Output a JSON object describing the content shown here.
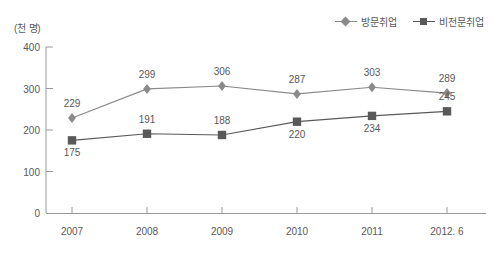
{
  "chart_data": {
    "type": "line",
    "title": "",
    "subtitle": "",
    "unit_label": "(천 명)",
    "xlabel": "",
    "ylabel": "",
    "categories": [
      "2007",
      "2008",
      "2009",
      "2010",
      "2011",
      "2012. 6"
    ],
    "yticks": [
      "0",
      "100",
      "200",
      "300",
      "400"
    ],
    "ylim": [
      0,
      400
    ],
    "grid": false,
    "legend_position": "top-right",
    "series": [
      {
        "name": "방문취업",
        "marker": "diamond",
        "color": "#8a8a8a",
        "values": [
          229,
          299,
          306,
          287,
          303,
          289
        ],
        "labels": [
          "229",
          "299",
          "306",
          "287",
          "303",
          "289"
        ]
      },
      {
        "name": "비전문취업",
        "marker": "square",
        "color": "#595959",
        "values": [
          175,
          191,
          188,
          220,
          234,
          245
        ],
        "labels": [
          "175",
          "191",
          "188",
          "220",
          "234",
          "245"
        ]
      }
    ]
  },
  "colors": {
    "series_visiting": "#8a8a8a",
    "series_nonprofessional": "#595959",
    "axis": "#9a9a9a",
    "text": "#58585a",
    "background": "#ffffff"
  }
}
